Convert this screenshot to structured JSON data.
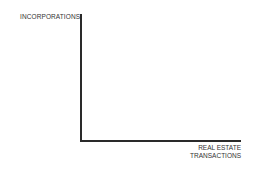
{
  "chart_data": {
    "type": "line",
    "title": "",
    "xlabel": "REAL ESTATE TRANSACTIONS",
    "ylabel": "INCORPORATIONS",
    "series": [],
    "x": [],
    "grid": false,
    "legend": null,
    "axes": {
      "x_ticks": [],
      "y_ticks": []
    }
  },
  "labels": {
    "y_axis": "INCORPORATIONS",
    "x_axis_line1": "REAL ESTATE",
    "x_axis_line2": "TRANSACTIONS"
  }
}
